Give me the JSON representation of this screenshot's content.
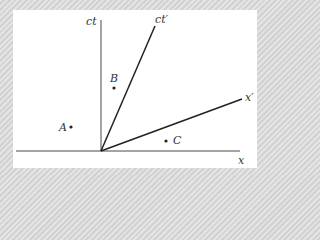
{
  "diagram": {
    "type": "spacetime-diagram",
    "axes": {
      "ct": {
        "label": "ct"
      },
      "ct_prime": {
        "label": "ct′"
      },
      "x_prime": {
        "label": "x′"
      },
      "x": {
        "label": "x"
      }
    },
    "events": [
      {
        "id": "A",
        "label": "A"
      },
      {
        "id": "B",
        "label": "B"
      },
      {
        "id": "C",
        "label": "C"
      }
    ],
    "colors": {
      "line": "#222222",
      "background": "#ffffff",
      "frame": "#d9d9d9"
    }
  }
}
